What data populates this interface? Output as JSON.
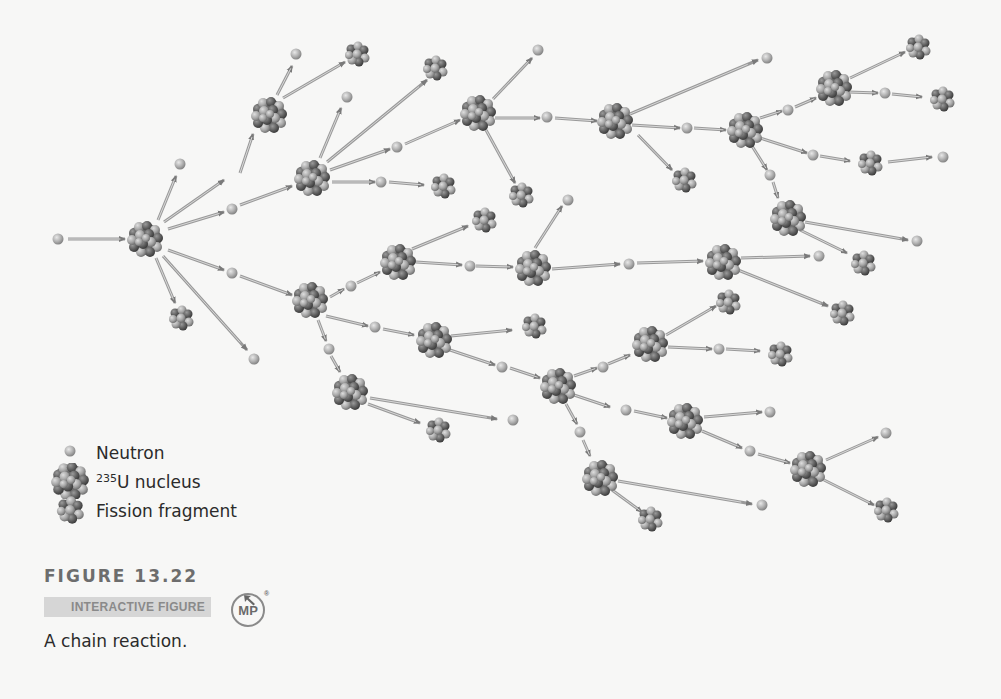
{
  "figure": {
    "number": "FIGURE 13.22",
    "interactive_label": "INTERACTIVE FIGURE",
    "badge": "MP",
    "badge_mark": "®",
    "caption": "A chain reaction."
  },
  "legend": {
    "items": [
      {
        "symbol": "neutron",
        "label": "Neutron"
      },
      {
        "symbol": "u235-nucleus",
        "label_sup": "235",
        "label": "U nucleus"
      },
      {
        "symbol": "fission-fragment",
        "label": "Fission fragment"
      }
    ]
  },
  "colors": {
    "background": "#f7f7f6",
    "neutron": "#a8a8a8",
    "nucleus_dark": "#555555",
    "nucleus_light": "#b5b5b5",
    "arrow": "#8c8c8c",
    "text": "#2b2b2b",
    "figure_number": "#6d6d6d",
    "interactive_bg": "#d6d6d6"
  },
  "diagram": {
    "nuclei": [
      {
        "id": "U1",
        "x": 145,
        "y": 239
      },
      {
        "id": "U2a",
        "x": 269,
        "y": 115
      },
      {
        "id": "U2b",
        "x": 312,
        "y": 178
      },
      {
        "id": "U2c",
        "x": 310,
        "y": 300
      },
      {
        "id": "U3a",
        "x": 478,
        "y": 113
      },
      {
        "id": "U3b",
        "x": 398,
        "y": 262
      },
      {
        "id": "U3c",
        "x": 434,
        "y": 340
      },
      {
        "id": "U3d",
        "x": 350,
        "y": 392
      },
      {
        "id": "U4a",
        "x": 615,
        "y": 121
      },
      {
        "id": "U4b",
        "x": 533,
        "y": 268
      },
      {
        "id": "U4c",
        "x": 558,
        "y": 386
      },
      {
        "id": "U4d",
        "x": 600,
        "y": 478
      },
      {
        "id": "U5a",
        "x": 745,
        "y": 130
      },
      {
        "id": "U5b",
        "x": 723,
        "y": 262
      },
      {
        "id": "U5c",
        "x": 650,
        "y": 344
      },
      {
        "id": "U5d",
        "x": 685,
        "y": 421
      },
      {
        "id": "U6a",
        "x": 834,
        "y": 88
      },
      {
        "id": "U6b",
        "x": 788,
        "y": 218
      },
      {
        "id": "U6c",
        "x": 808,
        "y": 469
      }
    ],
    "fragments": [
      {
        "x": 357,
        "y": 54
      },
      {
        "x": 435,
        "y": 68
      },
      {
        "x": 443,
        "y": 186
      },
      {
        "x": 181,
        "y": 318
      },
      {
        "x": 521,
        "y": 195
      },
      {
        "x": 484,
        "y": 220
      },
      {
        "x": 534,
        "y": 326
      },
      {
        "x": 438,
        "y": 430
      },
      {
        "x": 684,
        "y": 180
      },
      {
        "x": 918,
        "y": 47
      },
      {
        "x": 942,
        "y": 99
      },
      {
        "x": 870,
        "y": 163
      },
      {
        "x": 863,
        "y": 263
      },
      {
        "x": 842,
        "y": 313
      },
      {
        "x": 728,
        "y": 302
      },
      {
        "x": 780,
        "y": 354
      },
      {
        "x": 650,
        "y": 519
      },
      {
        "x": 886,
        "y": 510
      }
    ],
    "neutrons": [
      {
        "x": 58,
        "y": 239
      },
      {
        "x": 296,
        "y": 54
      },
      {
        "x": 347,
        "y": 97
      },
      {
        "x": 180,
        "y": 164
      },
      {
        "x": 232,
        "y": 209
      },
      {
        "x": 232,
        "y": 273
      },
      {
        "x": 254,
        "y": 359
      },
      {
        "x": 397,
        "y": 147
      },
      {
        "x": 381,
        "y": 182
      },
      {
        "x": 538,
        "y": 50
      },
      {
        "x": 547,
        "y": 117
      },
      {
        "x": 568,
        "y": 200
      },
      {
        "x": 351,
        "y": 286
      },
      {
        "x": 470,
        "y": 266
      },
      {
        "x": 375,
        "y": 327
      },
      {
        "x": 329,
        "y": 349
      },
      {
        "x": 502,
        "y": 367
      },
      {
        "x": 513,
        "y": 420
      },
      {
        "x": 767,
        "y": 58
      },
      {
        "x": 687,
        "y": 128
      },
      {
        "x": 788,
        "y": 110
      },
      {
        "x": 885,
        "y": 93
      },
      {
        "x": 813,
        "y": 155
      },
      {
        "x": 943,
        "y": 157
      },
      {
        "x": 770,
        "y": 175
      },
      {
        "x": 917,
        "y": 241
      },
      {
        "x": 629,
        "y": 264
      },
      {
        "x": 819,
        "y": 256
      },
      {
        "x": 603,
        "y": 367
      },
      {
        "x": 719,
        "y": 349
      },
      {
        "x": 580,
        "y": 432
      },
      {
        "x": 626,
        "y": 410
      },
      {
        "x": 770,
        "y": 412
      },
      {
        "x": 750,
        "y": 451
      },
      {
        "x": 886,
        "y": 433
      },
      {
        "x": 762,
        "y": 505
      }
    ],
    "arrows": [
      [
        68,
        239,
        125,
        239
      ],
      [
        158,
        220,
        176,
        176
      ],
      [
        164,
        222,
        224,
        180
      ],
      [
        240,
        173,
        253,
        134
      ],
      [
        168,
        229,
        224,
        212
      ],
      [
        240,
        205,
        292,
        186
      ],
      [
        168,
        250,
        224,
        270
      ],
      [
        240,
        276,
        292,
        295
      ],
      [
        156,
        258,
        175,
        303
      ],
      [
        163,
        256,
        247,
        350
      ],
      [
        277,
        95,
        292,
        66
      ],
      [
        283,
        98,
        345,
        62
      ],
      [
        320,
        158,
        341,
        108
      ],
      [
        327,
        162,
        427,
        80
      ],
      [
        330,
        170,
        390,
        149
      ],
      [
        405,
        144,
        460,
        120
      ],
      [
        332,
        182,
        375,
        182
      ],
      [
        389,
        182,
        424,
        185
      ],
      [
        493,
        99,
        532,
        58
      ],
      [
        495,
        118,
        540,
        118
      ],
      [
        555,
        118,
        597,
        121
      ],
      [
        486,
        130,
        515,
        183
      ],
      [
        630,
        114,
        758,
        60
      ],
      [
        632,
        125,
        680,
        128
      ],
      [
        694,
        128,
        726,
        130
      ],
      [
        638,
        135,
        672,
        170
      ],
      [
        760,
        118,
        782,
        111
      ],
      [
        795,
        107,
        816,
        98
      ],
      [
        850,
        78,
        905,
        52
      ],
      [
        848,
        92,
        878,
        93
      ],
      [
        892,
        94,
        922,
        97
      ],
      [
        760,
        138,
        807,
        153
      ],
      [
        820,
        156,
        850,
        161
      ],
      [
        888,
        162,
        932,
        157
      ],
      [
        752,
        146,
        767,
        170
      ],
      [
        773,
        182,
        778,
        198
      ],
      [
        805,
        222,
        908,
        240
      ],
      [
        800,
        230,
        847,
        253
      ],
      [
        330,
        297,
        344,
        289
      ],
      [
        357,
        283,
        380,
        272
      ],
      [
        412,
        249,
        468,
        226
      ],
      [
        416,
        262,
        462,
        265
      ],
      [
        476,
        266,
        513,
        267
      ],
      [
        535,
        248,
        562,
        206
      ],
      [
        552,
        269,
        620,
        264
      ],
      [
        637,
        263,
        703,
        261
      ],
      [
        741,
        258,
        810,
        256
      ],
      [
        738,
        270,
        828,
        306
      ],
      [
        326,
        316,
        368,
        326
      ],
      [
        383,
        329,
        414,
        335
      ],
      [
        451,
        336,
        512,
        330
      ],
      [
        450,
        350,
        495,
        365
      ],
      [
        510,
        368,
        540,
        378
      ],
      [
        318,
        320,
        326,
        341
      ],
      [
        331,
        356,
        340,
        372
      ],
      [
        370,
        398,
        497,
        419
      ],
      [
        368,
        404,
        420,
        423
      ],
      [
        574,
        376,
        597,
        368
      ],
      [
        608,
        364,
        630,
        355
      ],
      [
        666,
        335,
        716,
        306
      ],
      [
        668,
        347,
        712,
        349
      ],
      [
        726,
        349,
        760,
        351
      ],
      [
        574,
        395,
        610,
        407
      ],
      [
        634,
        411,
        667,
        418
      ],
      [
        704,
        417,
        762,
        412
      ],
      [
        702,
        431,
        742,
        448
      ],
      [
        758,
        454,
        790,
        463
      ],
      [
        826,
        460,
        878,
        437
      ],
      [
        824,
        480,
        874,
        505
      ],
      [
        566,
        404,
        577,
        424
      ],
      [
        583,
        440,
        590,
        456
      ],
      [
        618,
        481,
        752,
        504
      ],
      [
        612,
        490,
        642,
        512
      ]
    ]
  }
}
